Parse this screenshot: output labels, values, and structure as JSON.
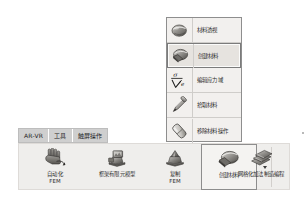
{
  "app": {
    "accent_selected_border": "#7b7b7b",
    "ribbon_bg": "#efeeec",
    "tabstrip_bg": "#cfcfcf"
  },
  "dropdown_menu": {
    "name": "material-tools-flyout",
    "items": [
      {
        "label": "材料透视",
        "icon": "material-xray-icon",
        "state": "normal"
      },
      {
        "label": "创建材料",
        "icon": "create-material-icon",
        "state": "selected"
      },
      {
        "label": "编辑应力域",
        "icon": "stress-strain-icon",
        "state": "normal"
      },
      {
        "label": "拾取材料",
        "icon": "eyedropper-icon",
        "state": "normal"
      },
      {
        "label": "移除材料操作",
        "icon": "eraser-icon",
        "state": "normal"
      }
    ]
  },
  "ribbon": {
    "tabs": [
      {
        "label": "AR-VR",
        "active": false
      },
      {
        "label": "工具",
        "active": false
      },
      {
        "label": "触屏操作",
        "active": true
      }
    ],
    "buttons": [
      {
        "label": "自动化\nFEM",
        "icon": "hand-gesture-icon",
        "selected": false,
        "has_dropdown": false
      },
      {
        "label": "框架有限元模型",
        "icon": "frame-fem-icon",
        "selected": false,
        "has_dropdown": false
      },
      {
        "label": "复制\nFEM",
        "icon": "copy-fem-icon",
        "selected": false,
        "has_dropdown": false
      },
      {
        "label": "创建材料",
        "icon": "create-material-icon",
        "selected": true,
        "has_dropdown": true
      },
      {
        "label": "网格化加法制造编程",
        "icon": "mesh-additive-icon",
        "selected": false,
        "has_dropdown": false
      }
    ]
  }
}
